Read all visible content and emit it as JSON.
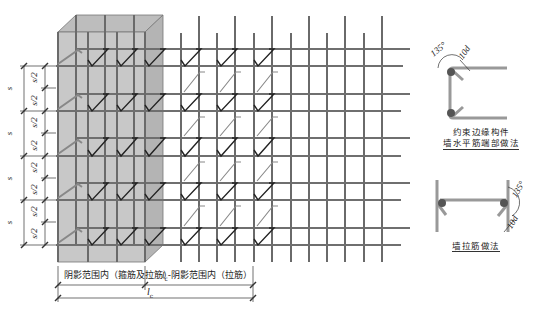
{
  "diagram": {
    "colors": {
      "shaded_zone": "#c8c8c8",
      "rebar": "#666666",
      "hook": "#222222",
      "dim_line": "#333333"
    },
    "left_dimensions": {
      "full_spacing_label": "s",
      "half_spacing_label": "s/2",
      "full_spacing_count": 4,
      "half_spacing_count": 8
    },
    "bottom_dimensions": {
      "shaded_zone_label": "阴影范围内（箍筋及拉筋）",
      "remaining_zone_label": "l",
      "remaining_zone_subscript": "c",
      "remaining_zone_suffix": "-阴影范围内（拉筋）",
      "total_label": "l",
      "total_subscript": "c"
    },
    "detail_1": {
      "angle_label": "135°",
      "length_label": "10d",
      "caption_line1": "约束边缘构件",
      "caption_line2": "墙水平筋端部做法"
    },
    "detail_2": {
      "angle_label": "135°",
      "length_label": "10d",
      "caption": "墙拉筋做法"
    }
  }
}
